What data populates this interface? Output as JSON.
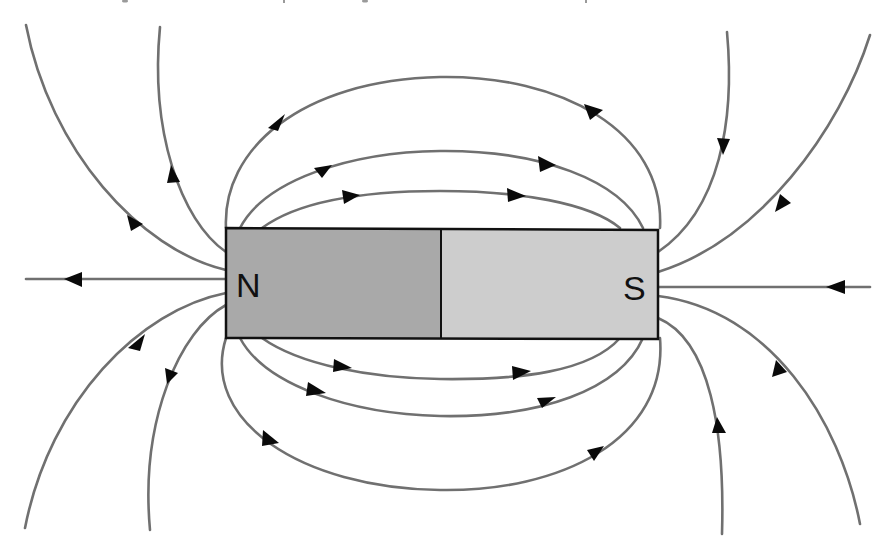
{
  "diagram": {
    "magnet": {
      "north_label": "N",
      "south_label": "S",
      "north_color": "#a9a9a9",
      "south_color": "#cdcdcd",
      "outline_color": "#111111"
    },
    "field_line_color": "#707070",
    "arrow_color": "#0a0a0a",
    "field_direction": "from N pole outward, into S pole"
  }
}
